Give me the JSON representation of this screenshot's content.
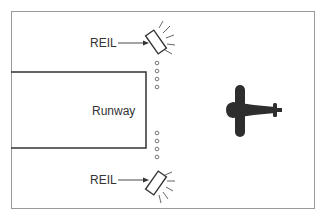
{
  "diagram": {
    "runway_label": "Runway",
    "reil_top_label": "REIL",
    "reil_bottom_label": "REIL",
    "icons": [
      "reil-light-icon",
      "runway-edge-light-icon",
      "airplane-icon"
    ],
    "colors": {
      "line": "#333333",
      "frame": "#9a9a9a",
      "airplane": "#2e2e2e",
      "background": "#ffffff"
    }
  }
}
